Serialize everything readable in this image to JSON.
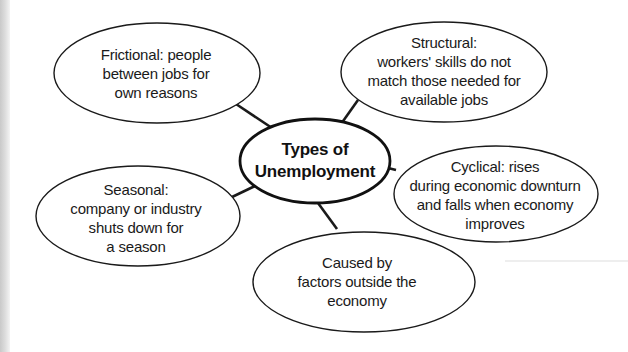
{
  "diagram": {
    "type": "concept-map",
    "center": {
      "lines": [
        "Types of",
        "Unemployment"
      ]
    },
    "nodes": [
      {
        "id": "frictional",
        "lines": [
          "Frictional: people",
          "between jobs for",
          "own reasons"
        ]
      },
      {
        "id": "structural",
        "lines": [
          "Structural:",
          "workers' skills do not",
          "match those needed for",
          "available jobs"
        ]
      },
      {
        "id": "cyclical",
        "lines": [
          "Cyclical: rises",
          "during economic downturn",
          "and falls when economy",
          "improves"
        ]
      },
      {
        "id": "seasonal",
        "lines": [
          "Seasonal:",
          "company or industry",
          "shuts down for",
          "a season"
        ]
      },
      {
        "id": "external",
        "lines": [
          "Caused by",
          "factors outside the",
          "economy"
        ]
      }
    ],
    "colors": {
      "stroke": "#1a1a1a",
      "text": "#1a1a1a",
      "background": "#ffffff"
    }
  }
}
